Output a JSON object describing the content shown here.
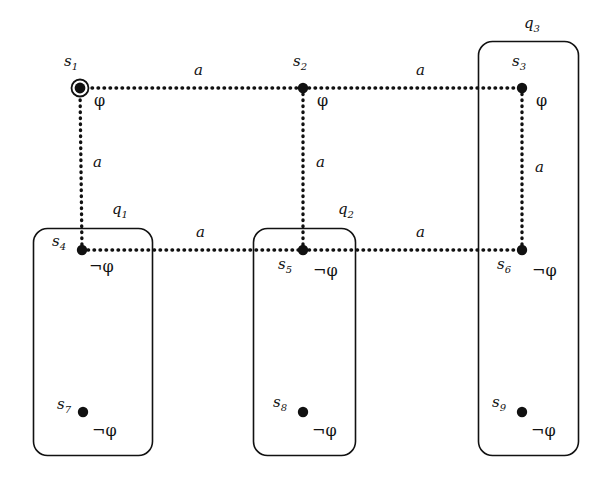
{
  "figure": {
    "type": "transition-system-diagram",
    "background": "#ffffff",
    "ink": "#111111",
    "width": 609,
    "height": 483
  },
  "symbols": {
    "phi": "φ",
    "not_phi": "¬φ",
    "action": "a"
  },
  "states": [
    {
      "id": "s1",
      "name": "s1",
      "label": "s",
      "sub": "1",
      "x": 80,
      "y": 88,
      "initial": true,
      "prop": "φ",
      "label_dx": -16,
      "label_dy": -25,
      "prop_dx": 14,
      "prop_dy": 8
    },
    {
      "id": "s2",
      "name": "s2",
      "label": "s",
      "sub": "2",
      "x": 303,
      "y": 88,
      "initial": false,
      "prop": "φ",
      "label_dx": -10,
      "label_dy": -25,
      "prop_dx": 14,
      "prop_dy": 8
    },
    {
      "id": "s3",
      "name": "s3",
      "label": "s",
      "sub": "3",
      "x": 522,
      "y": 88,
      "initial": false,
      "prop": "φ",
      "label_dx": -10,
      "label_dy": -25,
      "prop_dx": 14,
      "prop_dy": 8
    },
    {
      "id": "s4",
      "name": "s4",
      "label": "s",
      "sub": "4",
      "x": 82,
      "y": 250,
      "initial": false,
      "prop": "¬φ",
      "label_dx": -30,
      "label_dy": -7,
      "prop_dx": 7,
      "prop_dy": 12
    },
    {
      "id": "s5",
      "name": "s5",
      "label": "s",
      "sub": "5",
      "x": 303,
      "y": 250,
      "initial": false,
      "prop": "¬φ",
      "label_dx": -25,
      "label_dy": 16,
      "prop_dx": 10,
      "prop_dy": 16
    },
    {
      "id": "s6",
      "name": "s6",
      "label": "s",
      "sub": "6",
      "x": 522,
      "y": 250,
      "initial": false,
      "prop": "¬φ",
      "label_dx": -25,
      "label_dy": 16,
      "prop_dx": 10,
      "prop_dy": 16
    },
    {
      "id": "s7",
      "name": "s7",
      "label": "s",
      "sub": "7",
      "x": 83,
      "y": 412,
      "initial": false,
      "prop": "¬φ",
      "label_dx": -26,
      "label_dy": -6,
      "prop_dx": 9,
      "prop_dy": 14
    },
    {
      "id": "s8",
      "name": "s8",
      "label": "s",
      "sub": "8",
      "x": 303,
      "y": 412,
      "initial": false,
      "prop": "¬φ",
      "label_dx": -30,
      "label_dy": -8,
      "prop_dx": 9,
      "prop_dy": 14
    },
    {
      "id": "s9",
      "name": "s9",
      "label": "s",
      "sub": "9",
      "x": 522,
      "y": 412,
      "initial": false,
      "prop": "¬φ",
      "label_dx": -30,
      "label_dy": -8,
      "prop_dx": 9,
      "prop_dy": 14
    }
  ],
  "edges": [
    {
      "id": "e-s1-s2",
      "from": "s1",
      "to": "s2",
      "label": "a",
      "orientation": "horizontal",
      "label_x": 194,
      "label_y": 71
    },
    {
      "id": "e-s2-s3",
      "from": "s2",
      "to": "s3",
      "label": "a",
      "orientation": "horizontal",
      "label_x": 416,
      "label_y": 71
    },
    {
      "id": "e-s1-s4",
      "from": "s1",
      "to": "s4",
      "label": "a",
      "orientation": "vertical",
      "label_x": 93,
      "label_y": 163
    },
    {
      "id": "e-s2-s5",
      "from": "s2",
      "to": "s5",
      "label": "a",
      "orientation": "vertical",
      "label_x": 316,
      "label_y": 163
    },
    {
      "id": "e-s3-s6",
      "from": "s3",
      "to": "s6",
      "label": "a",
      "orientation": "vertical",
      "label_x": 535,
      "label_y": 168
    },
    {
      "id": "e-s4-s5",
      "from": "s4",
      "to": "s5",
      "label": "a",
      "orientation": "horizontal",
      "label_x": 196,
      "label_y": 233
    },
    {
      "id": "e-s5-s6",
      "from": "s5",
      "to": "s6",
      "label": "a",
      "orientation": "horizontal",
      "label_x": 416,
      "label_y": 233
    }
  ],
  "regions": [
    {
      "id": "q1",
      "label": "q",
      "sub": "1",
      "x": 33,
      "y": 228,
      "w": 119,
      "h": 227,
      "label_x": 112,
      "label_y": 210
    },
    {
      "id": "q2",
      "label": "q",
      "sub": "2",
      "x": 253,
      "y": 228,
      "w": 102,
      "h": 227,
      "label_x": 338,
      "label_y": 210
    },
    {
      "id": "q3",
      "label": "q",
      "sub": "3",
      "x": 478,
      "y": 41,
      "w": 100,
      "h": 414,
      "label_x": 524,
      "label_y": 24
    }
  ]
}
